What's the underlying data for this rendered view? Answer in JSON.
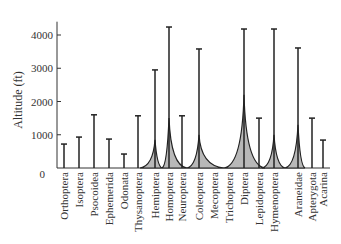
{
  "chart_data": {
    "type": "bar",
    "title": "",
    "xlabel": "",
    "ylabel": "Altitude (ft)",
    "ylim": [
      0,
      4400
    ],
    "yticks": [
      0,
      1000,
      2000,
      3000,
      4000
    ],
    "grid": false,
    "legend": null,
    "categories": [
      "Orthoptera",
      "Isoptera",
      "Psocoidea",
      "Ephemerida",
      "Odonata",
      "Thysanoptera",
      "Hemiptera",
      "Homoptera",
      "Neuroptera",
      "Coleoptera",
      "Mecoptera",
      "Trichoptera",
      "Diptera",
      "Lepidoptera",
      "Hymenoptera",
      "Araneidae",
      "Apterygota",
      "Acarina"
    ],
    "series": [
      {
        "name": "Maximum altitude",
        "values": [
          720,
          930,
          1600,
          870,
          420,
          1570,
          2950,
          4240,
          1570,
          3580,
          0,
          0,
          4180,
          1500,
          4180,
          3610,
          1500,
          840
        ]
      },
      {
        "name": "Abundance profile (shaded)",
        "values": [
          0,
          0,
          0,
          0,
          0,
          0,
          850,
          1500,
          0,
          1000,
          0,
          0,
          2200,
          0,
          1000,
          1300,
          0,
          0
        ]
      }
    ],
    "annotations": "Vertical lines show altitudinal extent of each group; gray shaded peaks show relative abundance distributions for Hemiptera, Homoptera, Coleoptera, Diptera, Hymenoptera, Araneidae."
  },
  "colors": {
    "axis": "#333333",
    "line": "#222222",
    "fill": "#b8b8b8"
  }
}
